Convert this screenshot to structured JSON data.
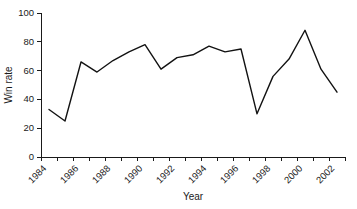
{
  "chart_data": {
    "type": "line",
    "title": "",
    "xlabel": "Year",
    "ylabel": "Win rate",
    "xlim": [
      1984,
      2003
    ],
    "ylim": [
      0,
      100
    ],
    "grid": false,
    "legend": null,
    "y_ticks": [
      0,
      20,
      40,
      60,
      80,
      100
    ],
    "y_tick_labels": [
      "0",
      "20",
      "40",
      "60",
      "80",
      "100"
    ],
    "x_ticks": [
      1984,
      1985,
      1986,
      1987,
      1988,
      1989,
      1990,
      1991,
      1992,
      1993,
      1994,
      1995,
      1996,
      1997,
      1998,
      1999,
      2000,
      2001,
      2002,
      2003
    ],
    "x_tick_labels": [
      "1984",
      "",
      "1986",
      "",
      "1988",
      "",
      "1990",
      "",
      "1992",
      "",
      "1994",
      "",
      "1996",
      "",
      "1998",
      "",
      "2000",
      "",
      "2002",
      ""
    ],
    "x_tick_labels_shown": [
      "1984",
      "1986",
      "1988",
      "1990",
      "1992",
      "1994",
      "1996",
      "1998",
      "2000",
      "2002"
    ],
    "x": [
      1984.5,
      1985.5,
      1986.5,
      1987.5,
      1988.5,
      1989.5,
      1990.5,
      1991.5,
      1992.5,
      1993.5,
      1994.5,
      1995.5,
      1996.5,
      1997.5,
      1998.5,
      1999.5,
      2000.5,
      2001.5,
      2002.5
    ],
    "values": [
      33,
      25,
      66,
      59,
      67,
      73,
      78,
      61,
      69,
      71,
      77,
      73,
      75,
      30,
      56,
      68,
      88,
      61,
      45
    ],
    "series": [
      {
        "name": "Win rate",
        "color": "#121212",
        "values": [
          33,
          25,
          66,
          59,
          67,
          73,
          78,
          61,
          69,
          71,
          77,
          73,
          75,
          30,
          56,
          68,
          88,
          61,
          45
        ]
      }
    ]
  },
  "axes": {
    "x_axis_title": "Year",
    "y_axis_title": "Win rate"
  }
}
